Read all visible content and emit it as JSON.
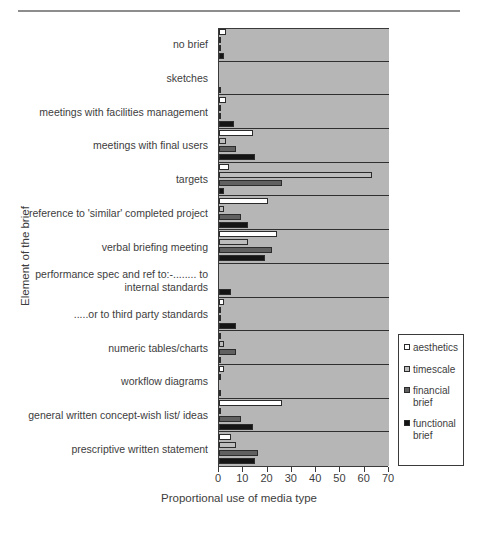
{
  "chart_data": {
    "type": "bar",
    "orientation": "horizontal",
    "title": "",
    "xlabel": "Proportional use of media type",
    "ylabel": "Element of the brief",
    "xlim": [
      0,
      70
    ],
    "xticks": [
      0,
      10,
      20,
      30,
      40,
      50,
      60,
      70
    ],
    "grid": false,
    "legend_position": "right",
    "categories": [
      "no brief",
      "sketches",
      "meetings with facilities management",
      "meetings with final users",
      "targets",
      "reference to 'similar' completed project",
      "verbal briefing meeting",
      "performance spec and ref to:-........ to internal standards",
      ".....or to third party standards",
      "numeric tables/charts",
      "workflow diagrams",
      "general written concept-wish list/ ideas",
      "prescriptive written statement"
    ],
    "series": [
      {
        "name": "aesthetics",
        "color": "#ffffff",
        "values": [
          3,
          0,
          3,
          14,
          4,
          20,
          24,
          0,
          2,
          1,
          2,
          26,
          5
        ]
      },
      {
        "name": "timescale",
        "color": "#bdbdbd",
        "values": [
          1,
          0,
          1,
          3,
          63,
          2,
          12,
          0,
          1,
          2,
          1,
          1,
          7
        ]
      },
      {
        "name": "financial brief",
        "color": "#606060",
        "values": [
          1,
          0,
          1,
          7,
          26,
          9,
          22,
          0,
          1,
          7,
          0,
          9,
          16
        ]
      },
      {
        "name": "functional brief",
        "color": "#141414",
        "values": [
          2,
          1,
          6,
          15,
          2,
          12,
          19,
          5,
          7,
          1,
          1,
          14,
          15
        ]
      }
    ]
  },
  "legend": {
    "items": [
      {
        "label": "aesthetics",
        "color": "#ffffff"
      },
      {
        "label": "timescale",
        "color": "#bdbdbd"
      },
      {
        "label": "financial brief",
        "color": "#606060"
      },
      {
        "label": "functional brief",
        "color": "#141414"
      }
    ]
  },
  "axis": {
    "x_label": "Proportional use of media type",
    "y_label": "Element of the brief",
    "x_ticks": [
      "0",
      "10",
      "20",
      "30",
      "40",
      "50",
      "60",
      "70"
    ]
  }
}
